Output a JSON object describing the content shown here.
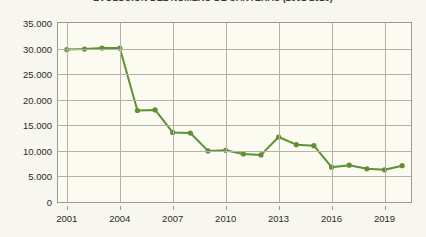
{
  "chart_data": {
    "type": "line",
    "title": "EVOLUCIÓN DEL NÚMERO DE CANTERAS (2001-2020)",
    "xlabel": "",
    "ylabel": "",
    "x": [
      2001,
      2002,
      2003,
      2004,
      2005,
      2006,
      2007,
      2008,
      2009,
      2010,
      2011,
      2012,
      2013,
      2014,
      2015,
      2016,
      2017,
      2018,
      2019,
      2020
    ],
    "values": [
      29800,
      29900,
      30100,
      30100,
      17900,
      18000,
      13600,
      13500,
      10000,
      10100,
      9400,
      9200,
      12700,
      11200,
      11000,
      6800,
      7200,
      6500,
      6300,
      7100
    ],
    "series": [
      {
        "name": "Canteras",
        "values": [
          29800,
          29900,
          30100,
          30100,
          17900,
          18000,
          13600,
          13500,
          10000,
          10100,
          9400,
          9200,
          12700,
          11200,
          11000,
          6800,
          7200,
          6500,
          6300,
          7100
        ]
      }
    ],
    "ylim": [
      0,
      35000
    ],
    "xlim": [
      2000.5,
      2020.5
    ],
    "yticks": [
      0,
      5000,
      10000,
      15000,
      20000,
      25000,
      30000,
      35000
    ],
    "ytick_labels": [
      "0",
      "5.000",
      "10.000",
      "15.000",
      "20.000",
      "25.000",
      "30.000",
      "35.000"
    ],
    "xticks": [
      2001,
      2004,
      2007,
      2010,
      2013,
      2016,
      2019
    ],
    "xtick_labels": [
      "2001",
      "2004",
      "2007",
      "2010",
      "2013",
      "2016",
      "2019"
    ],
    "grid": true,
    "grid_axes": "both",
    "legend": false,
    "legend_position": "none",
    "colors": {
      "line": "#5f9133",
      "marker": "#5f9133",
      "grid": "#b2b2a8",
      "axis": "#9a9a90",
      "background": "#fbfbf2",
      "page_background": "#f7f7ef",
      "text": "#2b2b2b"
    },
    "line_width": 2,
    "marker": "circle",
    "marker_size": 4
  }
}
